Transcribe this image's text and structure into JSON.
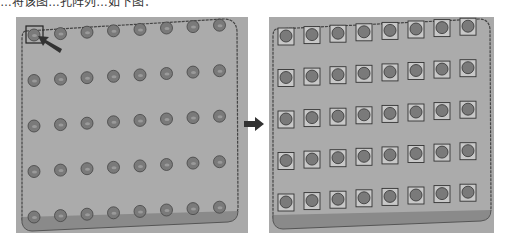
{
  "caption": {
    "text": "…将该图…孔阵列…如下图："
  },
  "left_panel": {
    "label": "Before: single hole feature selected",
    "rows": 5,
    "cols": 8,
    "feature": "round-hole",
    "selected_feature": {
      "row": 1,
      "col": 1
    }
  },
  "right_panel": {
    "label": "After: hole pattern array result",
    "rows": 5,
    "cols": 8,
    "feature": "square-pad-with-hole"
  },
  "arrow": {
    "direction": "right"
  },
  "colors": {
    "panel_bg": "#a9a9a9",
    "plate_edge": "#555555",
    "hole": "#7a7a7a",
    "pad": "#c8c8c8"
  }
}
